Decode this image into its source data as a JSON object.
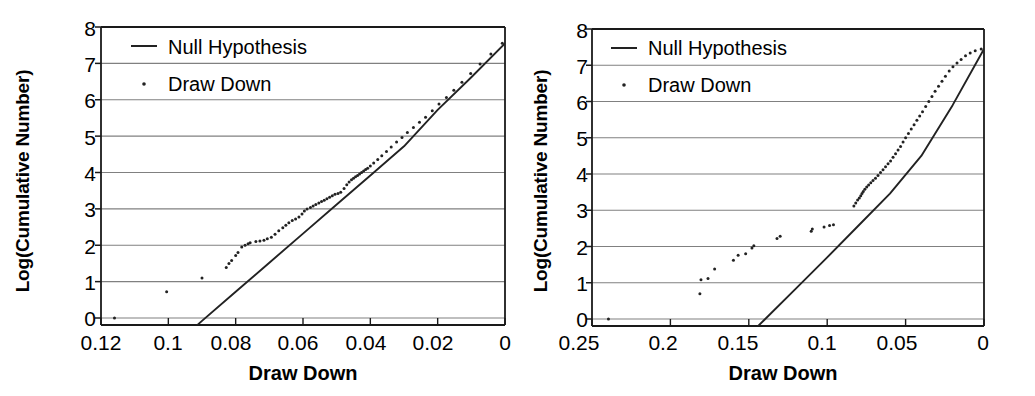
{
  "figure": {
    "background": "#ffffff",
    "axis_color": "#1a1a1a",
    "grid_color": "#808080",
    "series_color": "#222222"
  },
  "panels": [
    {
      "id": "left",
      "ylabel": "Log(Cumulative Number)",
      "xlabel": "Draw Down",
      "legend": [
        {
          "label": "Null Hypothesis",
          "marker": "line"
        },
        {
          "label": "Draw Down",
          "marker": "dot"
        }
      ],
      "yticks": [
        "8",
        "7",
        "6",
        "5",
        "4",
        "3",
        "2",
        "1",
        "0"
      ],
      "xticks": [
        "0.12",
        "0.1",
        "0.08",
        "0.06",
        "0.04",
        "0.02",
        "0"
      ]
    },
    {
      "id": "right",
      "ylabel": "Log(Cumulative Number)",
      "xlabel": "Draw Down",
      "legend": [
        {
          "label": "Null Hypothesis",
          "marker": "line"
        },
        {
          "label": "Draw Down",
          "marker": "dot"
        }
      ],
      "yticks": [
        "8",
        "7",
        "6",
        "5",
        "4",
        "3",
        "2",
        "1",
        "0"
      ],
      "xticks": [
        "0.25",
        "0.2",
        "0.15",
        "0.1",
        "0.05",
        "0"
      ]
    }
  ],
  "chart_data": [
    {
      "type": "scatter",
      "panel": "left",
      "title": "",
      "xlabel": "Draw Down",
      "ylabel": "Log(Cumulative Number)",
      "xlim": [
        0.12,
        0.0
      ],
      "ylim": [
        -0.45,
        8.0
      ],
      "x_reversed": true,
      "grid": "horizontal",
      "legend_position": "top-left",
      "series": [
        {
          "name": "Null Hypothesis",
          "type": "line",
          "x": [
            0.0945,
            0.09,
            0.08,
            0.07,
            0.06,
            0.05,
            0.04,
            0.03,
            0.02,
            0.01,
            0.0
          ],
          "y": [
            -0.45,
            -0.08,
            0.72,
            1.52,
            2.32,
            3.12,
            3.92,
            4.72,
            5.72,
            6.62,
            7.55
          ]
        },
        {
          "name": "Draw Down",
          "type": "scatter",
          "x": [
            0.116,
            0.1005,
            0.09,
            0.0828,
            0.082,
            0.0812,
            0.08,
            0.0793,
            0.0782,
            0.0772,
            0.0763,
            0.0757,
            0.074,
            0.0728,
            0.0716,
            0.0706,
            0.0694,
            0.0683,
            0.0672,
            0.066,
            0.0651,
            0.0642,
            0.0632,
            0.0622,
            0.0612,
            0.0603,
            0.0596,
            0.0588,
            0.0578,
            0.057,
            0.0562,
            0.0553,
            0.0545,
            0.0537,
            0.0529,
            0.0521,
            0.0513,
            0.0505,
            0.0496,
            0.0488,
            0.0478,
            0.047,
            0.0463,
            0.0456,
            0.045,
            0.0444,
            0.0438,
            0.0432,
            0.0426,
            0.042,
            0.0414,
            0.0408,
            0.04,
            0.039,
            0.0378,
            0.0366,
            0.0352,
            0.0338,
            0.0322,
            0.0306,
            0.029,
            0.0272,
            0.0254,
            0.0236,
            0.0216,
            0.0196,
            0.0174,
            0.0152,
            0.0128,
            0.0102,
            0.0074,
            0.0042,
            0.0008
          ],
          "y": [
            0.0,
            0.72,
            1.1,
            1.39,
            1.5,
            1.58,
            1.72,
            1.8,
            1.95,
            2.0,
            2.04,
            2.07,
            2.1,
            2.12,
            2.14,
            2.18,
            2.22,
            2.3,
            2.4,
            2.48,
            2.55,
            2.62,
            2.68,
            2.72,
            2.78,
            2.86,
            2.94,
            3.0,
            3.04,
            3.08,
            3.12,
            3.16,
            3.2,
            3.24,
            3.28,
            3.32,
            3.36,
            3.4,
            3.42,
            3.46,
            3.56,
            3.66,
            3.74,
            3.8,
            3.84,
            3.88,
            3.92,
            3.96,
            4.0,
            4.04,
            4.08,
            4.12,
            4.18,
            4.26,
            4.36,
            4.46,
            4.58,
            4.7,
            4.84,
            4.96,
            5.1,
            5.24,
            5.38,
            5.52,
            5.7,
            5.88,
            6.06,
            6.26,
            6.48,
            6.72,
            6.98,
            7.26,
            7.55
          ]
        }
      ]
    },
    {
      "type": "scatter",
      "panel": "right",
      "title": "",
      "xlabel": "Draw Down",
      "ylabel": "Log(Cumulative Number)",
      "xlim": [
        0.25,
        0.0
      ],
      "ylim": [
        -0.45,
        8.0
      ],
      "x_reversed": true,
      "grid": "horizontal",
      "legend_position": "top-left",
      "series": [
        {
          "name": "Null Hypothesis",
          "type": "line",
          "x": [
            0.15,
            0.14,
            0.12,
            0.1,
            0.08,
            0.06,
            0.04,
            0.02,
            0.0
          ],
          "y": [
            -0.45,
            -0.02,
            0.84,
            1.7,
            2.58,
            3.46,
            4.5,
            5.9,
            7.45
          ]
        },
        {
          "name": "Draw Down",
          "type": "scatter",
          "x": [
            0.2395,
            0.1812,
            0.1805,
            0.176,
            0.1718,
            0.1598,
            0.1568,
            0.152,
            0.148,
            0.1468,
            0.132,
            0.13,
            0.1102,
            0.1095,
            0.102,
            0.0985,
            0.096,
            0.083,
            0.0818,
            0.0806,
            0.0795,
            0.0786,
            0.0778,
            0.077,
            0.076,
            0.0748,
            0.0736,
            0.0722,
            0.0708,
            0.0692,
            0.0676,
            0.066,
            0.0644,
            0.0628,
            0.0612,
            0.0596,
            0.058,
            0.0564,
            0.0548,
            0.0532,
            0.0516,
            0.05,
            0.0482,
            0.0464,
            0.0446,
            0.0428,
            0.041,
            0.0392,
            0.0372,
            0.0352,
            0.0332,
            0.0312,
            0.029,
            0.0268,
            0.0246,
            0.0222,
            0.0198,
            0.0172,
            0.0146,
            0.0118,
            0.0088,
            0.0056,
            0.0018
          ],
          "y": [
            0.0,
            0.7,
            1.08,
            1.12,
            1.38,
            1.62,
            1.76,
            1.8,
            1.96,
            2.02,
            2.22,
            2.28,
            2.42,
            2.48,
            2.54,
            2.58,
            2.6,
            3.12,
            3.2,
            3.28,
            3.34,
            3.4,
            3.46,
            3.52,
            3.58,
            3.64,
            3.7,
            3.76,
            3.82,
            3.88,
            3.96,
            4.04,
            4.12,
            4.2,
            4.28,
            4.36,
            4.46,
            4.56,
            4.66,
            4.76,
            4.88,
            5.0,
            5.12,
            5.24,
            5.36,
            5.48,
            5.6,
            5.72,
            5.86,
            6.0,
            6.14,
            6.28,
            6.42,
            6.56,
            6.7,
            6.84,
            6.96,
            7.06,
            7.16,
            7.26,
            7.34,
            7.4,
            7.45
          ]
        }
      ]
    }
  ]
}
